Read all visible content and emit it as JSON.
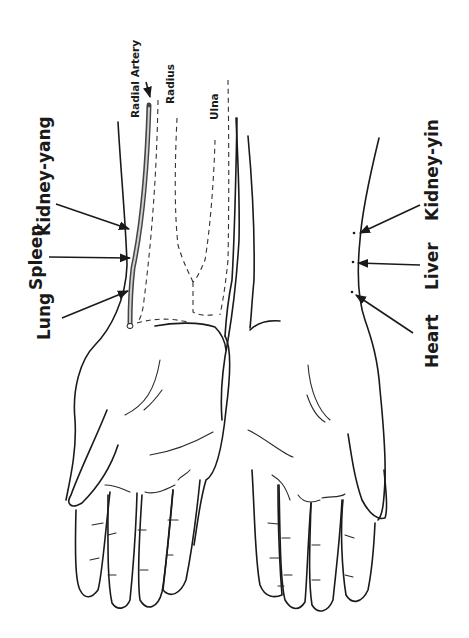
{
  "diagram": {
    "type": "anatomical pulse-position diagram",
    "orientation": "rotated 90 degrees (labels read bottom-to-top)",
    "colors": {
      "ink": "#1a1a1a",
      "background": "#ffffff"
    },
    "left_arm": {
      "pulse_labels": [
        {
          "label": "Lung",
          "position": "proximal-to-wrist (distal)"
        },
        {
          "label": "Spleen",
          "position": "middle"
        },
        {
          "label": "Kidney-yang",
          "position": "proximal"
        }
      ],
      "anatomy_labels": {
        "radial_artery": "Radial Artery",
        "radius": "Radius",
        "ulna": "Ulna"
      }
    },
    "right_arm": {
      "pulse_labels": [
        {
          "label": "Heart",
          "position": "distal"
        },
        {
          "label": "Liver",
          "position": "middle"
        },
        {
          "label": "Kidney-yin",
          "position": "proximal"
        }
      ]
    }
  }
}
